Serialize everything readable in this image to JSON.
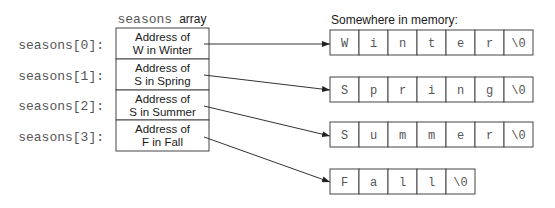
{
  "array_title": {
    "name": "seasons",
    "suffix": "array"
  },
  "memory_title": "Somewhere in memory:",
  "array": [
    {
      "label": "seasons[0]:",
      "line1": "Address of",
      "line2": "W in Winter"
    },
    {
      "label": "seasons[1]:",
      "line1": "Address of",
      "line2": "S in Spring"
    },
    {
      "label": "seasons[2]:",
      "line1": "Address of",
      "line2": "S in Summer"
    },
    {
      "label": "seasons[3]:",
      "line1": "Address of",
      "line2": "F in Fall"
    }
  ],
  "strings": [
    {
      "word": "Winter",
      "chars": [
        "W",
        "i",
        "n",
        "t",
        "e",
        "r",
        "\\0"
      ]
    },
    {
      "word": "Spring",
      "chars": [
        "S",
        "p",
        "r",
        "i",
        "n",
        "g",
        "\\0"
      ]
    },
    {
      "word": "Summer",
      "chars": [
        "S",
        "u",
        "m",
        "m",
        "e",
        "r",
        "\\0"
      ]
    },
    {
      "word": "Fall",
      "chars": [
        "F",
        "a",
        "l",
        "l",
        "\\0"
      ]
    }
  ]
}
